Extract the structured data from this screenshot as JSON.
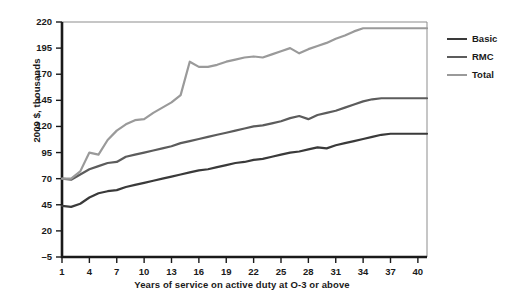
{
  "chart_data": {
    "type": "line",
    "title": "",
    "subtitle": "",
    "xlabel": "Years of service on active duty at O-3 or above",
    "ylabel": "2009 $, thousands",
    "xlim": [
      1,
      41
    ],
    "ylim": [
      -5,
      220
    ],
    "xticks": [
      1,
      4,
      7,
      10,
      13,
      16,
      19,
      22,
      25,
      28,
      31,
      34,
      37,
      40
    ],
    "yticks": [
      -5,
      20,
      45,
      70,
      95,
      120,
      145,
      170,
      195,
      220
    ],
    "grid": false,
    "legend_position": "right",
    "x": [
      1,
      2,
      3,
      4,
      5,
      6,
      7,
      8,
      9,
      10,
      11,
      12,
      13,
      14,
      15,
      16,
      17,
      18,
      19,
      20,
      21,
      22,
      23,
      24,
      25,
      26,
      27,
      28,
      29,
      30,
      31,
      32,
      33,
      34,
      35,
      36,
      37,
      38,
      39,
      40,
      41
    ],
    "series": [
      {
        "name": "Basic",
        "color": "#3a3a3a",
        "values": [
          44,
          43,
          46,
          52,
          56,
          58,
          59,
          62,
          64,
          66,
          68,
          70,
          72,
          74,
          76,
          78,
          79,
          81,
          83,
          85,
          86,
          88,
          89,
          91,
          93,
          95,
          96,
          98,
          100,
          99,
          102,
          104,
          106,
          108,
          110,
          112,
          113,
          113,
          113,
          113,
          113
        ]
      },
      {
        "name": "RMC",
        "color": "#5c5c5c",
        "values": [
          70,
          69,
          74,
          79,
          82,
          85,
          86,
          91,
          93,
          95,
          97,
          99,
          101,
          104,
          106,
          108,
          110,
          112,
          114,
          116,
          118,
          120,
          121,
          123,
          125,
          128,
          130,
          127,
          131,
          133,
          135,
          138,
          141,
          144,
          146,
          147,
          147,
          147,
          147,
          147,
          147
        ]
      },
      {
        "name": "Total",
        "color": "#9a9a9a",
        "values": [
          70,
          70,
          77,
          95,
          93,
          107,
          116,
          122,
          126,
          127,
          133,
          138,
          143,
          150,
          182,
          177,
          177,
          179,
          182,
          184,
          186,
          187,
          186,
          189,
          192,
          195,
          190,
          194,
          197,
          200,
          204,
          207,
          211,
          214,
          214,
          214,
          214,
          214,
          214,
          214,
          214
        ]
      }
    ]
  },
  "legend": {
    "items": [
      {
        "label": "Basic",
        "color": "#3a3a3a"
      },
      {
        "label": "RMC",
        "color": "#5c5c5c"
      },
      {
        "label": "Total",
        "color": "#9a9a9a"
      }
    ]
  },
  "axis": {
    "y_title": "2009 $, thousands",
    "x_title": "Years of service on active duty at O-3 or above",
    "y_tick_labels": [
      "220",
      "195",
      "170",
      "145",
      "120",
      "95",
      "70",
      "45",
      "20",
      "–5"
    ],
    "x_tick_labels": [
      "1",
      "4",
      "7",
      "10",
      "13",
      "16",
      "19",
      "22",
      "25",
      "28",
      "31",
      "34",
      "37",
      "40"
    ]
  },
  "colors": {
    "axis": "#1a1a1a",
    "plot_border": "#8d8d8d",
    "background": "#ffffff"
  }
}
